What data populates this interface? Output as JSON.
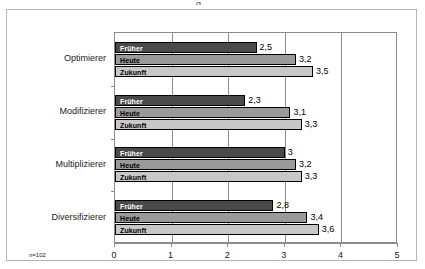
{
  "figure": {
    "note": "n=102",
    "title_sliver": "g"
  },
  "chart_data": {
    "type": "bar",
    "orientation": "horizontal",
    "title": "",
    "xlabel": "",
    "ylabel": "",
    "xlim": [
      0,
      5
    ],
    "xticks": [
      "0",
      "1",
      "2",
      "3",
      "4",
      "5"
    ],
    "grid": true,
    "legend": "inside-bars",
    "categories": [
      "Optimierer",
      "Modifizierer",
      "Multiplizierer",
      "Diversifizierer"
    ],
    "series": [
      {
        "name": "Früher",
        "color": "#4a4a4a",
        "values": [
          2.5,
          2.3,
          3.0,
          2.8
        ],
        "labels": [
          "2,5",
          "2,3",
          "3",
          "2,8"
        ]
      },
      {
        "name": "Heute",
        "color": "#9a9a9a",
        "values": [
          3.2,
          3.1,
          3.2,
          3.4
        ],
        "labels": [
          "3,2",
          "3,1",
          "3,2",
          "3,4"
        ]
      },
      {
        "name": "Zukunft",
        "color": "#c8c8c8",
        "values": [
          3.5,
          3.3,
          3.3,
          3.6
        ],
        "labels": [
          "3,5",
          "3,3",
          "3,3",
          "3,6"
        ]
      }
    ]
  }
}
